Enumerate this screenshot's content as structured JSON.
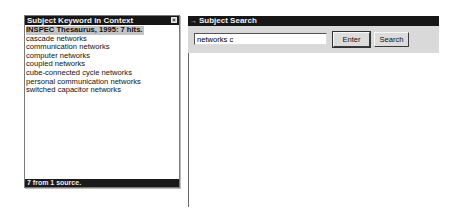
{
  "kwic_panel": {
    "title": "Subject Keyword in Context",
    "header_row": "INSPEC Thesaurus, 1995: 7 hits.",
    "items": [
      "cascade networks",
      "communication networks",
      "computer networks",
      "coupled networks",
      "cube-connected cycle networks",
      "personal communication networks",
      "switched capacitor networks"
    ],
    "status": "7 from 1 source."
  },
  "search_panel": {
    "title": "Subject Search",
    "title_icon": "arrow-icon",
    "input_value": "networks c",
    "enter_label": "Enter",
    "search_label": "Search"
  },
  "colors": {
    "titlebar": "#161616",
    "toolbar": "#d9d9d9",
    "highlight": "#c4c4c4"
  }
}
